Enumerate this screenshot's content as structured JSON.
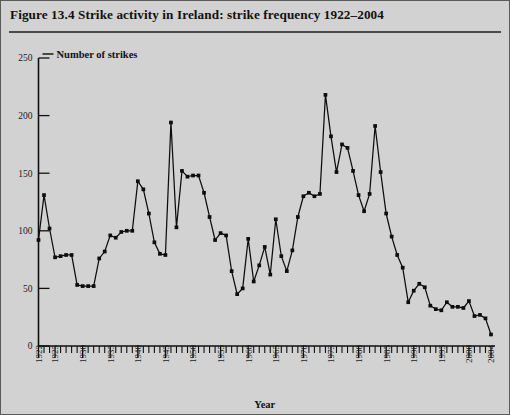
{
  "figure": {
    "caption": "Figure 13.4  Strike activity in Ireland: strike frequency 1922–2004",
    "series_name": "Number of strikes",
    "xaxis_name": "Year"
  },
  "chart_data": {
    "type": "line",
    "title": "Figure 13.4  Strike activity in Ireland: strike frequency 1922–2004",
    "xlabel": "Year",
    "ylabel": "Number of strikes",
    "series_label": "Number of strikes",
    "xlim": [
      1922,
      2004
    ],
    "ylim": [
      0,
      250
    ],
    "yticks": [
      0,
      50,
      100,
      150,
      200,
      250
    ],
    "xticks_major": [
      1922,
      1925,
      1930,
      1935,
      1940,
      1945,
      1950,
      1955,
      1960,
      1965,
      1970,
      1975,
      1980,
      1985,
      1990,
      1995,
      2000,
      2004
    ],
    "xtick_interval_minor": 1,
    "grid": false,
    "legend": "inline-top-left",
    "marker": "square",
    "line_color": "#0d0d0d",
    "background_color": "#d2d2d2",
    "x": [
      1922,
      1923,
      1924,
      1925,
      1926,
      1927,
      1928,
      1929,
      1930,
      1931,
      1932,
      1933,
      1934,
      1935,
      1936,
      1937,
      1938,
      1939,
      1940,
      1941,
      1942,
      1943,
      1944,
      1945,
      1946,
      1947,
      1948,
      1949,
      1950,
      1951,
      1952,
      1953,
      1954,
      1955,
      1956,
      1957,
      1958,
      1959,
      1960,
      1961,
      1962,
      1963,
      1964,
      1965,
      1966,
      1967,
      1968,
      1969,
      1970,
      1971,
      1972,
      1973,
      1974,
      1975,
      1976,
      1977,
      1978,
      1979,
      1980,
      1981,
      1982,
      1983,
      1984,
      1985,
      1986,
      1987,
      1988,
      1989,
      1990,
      1991,
      1992,
      1993,
      1994,
      1995,
      1996,
      1997,
      1998,
      1999,
      2000,
      2001,
      2002,
      2003,
      2004
    ],
    "y": [
      92,
      131,
      102,
      77,
      78,
      79,
      79,
      53,
      52,
      52,
      52,
      76,
      82,
      96,
      94,
      99,
      100,
      100,
      143,
      136,
      115,
      90,
      80,
      79,
      194,
      103,
      152,
      147,
      148,
      148,
      133,
      112,
      92,
      98,
      96,
      65,
      45,
      50,
      93,
      56,
      70,
      86,
      62,
      110,
      78,
      65,
      83,
      112,
      130,
      133,
      130,
      132,
      218,
      182,
      151,
      175,
      172,
      152,
      131,
      117,
      132,
      191,
      151,
      115,
      95,
      79,
      68,
      38,
      48,
      54,
      51,
      35,
      32,
      31,
      38,
      34,
      34,
      33,
      39,
      26,
      27,
      24,
      10
    ]
  }
}
